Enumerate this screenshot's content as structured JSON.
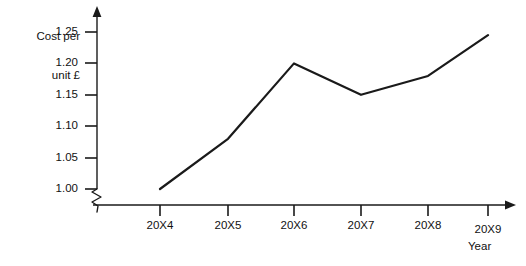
{
  "chart_data": {
    "type": "line",
    "title": "",
    "subtitle": "",
    "xlabel": "Year",
    "ylabel": "Cost per unit £",
    "categories": [
      "20X4",
      "20X5",
      "20X6",
      "20X7",
      "20X8",
      "20X9"
    ],
    "values": [
      1.0,
      1.08,
      1.2,
      1.15,
      1.18,
      1.245
    ],
    "series": [
      {
        "name": "Cost per unit",
        "values": [
          1.0,
          1.08,
          1.2,
          1.15,
          1.18,
          1.245
        ]
      }
    ],
    "ylim": [
      1.0,
      1.25
    ],
    "ytick_labels": [
      "1.25",
      "1.20",
      "1.15",
      "1.10",
      "1.05",
      "1.00"
    ],
    "ytick_values": [
      1.25,
      1.2,
      1.15,
      1.1,
      1.05,
      1.0
    ],
    "xtick_labels": [
      "20X4",
      "20X5",
      "20X6",
      "20X7",
      "20X8",
      "20X9"
    ],
    "grid": false,
    "legend": false,
    "legend_position": "none",
    "axis_break": true,
    "axis_break_note": "zigzag break on y-axis below 1.00",
    "line_color": "#1a1a1a",
    "axis_color": "#1a1a1a",
    "background_color": "#ffffff",
    "annotations": []
  },
  "labels": {
    "y_axis_title_line1": "Cost per",
    "y_axis_title_line2": "unit £",
    "x_axis_title": "Year"
  },
  "y_ticks": [
    {
      "label": "1.25"
    },
    {
      "label": "1.20"
    },
    {
      "label": "1.15"
    },
    {
      "label": "1.10"
    },
    {
      "label": "1.05"
    },
    {
      "label": "1.00"
    }
  ],
  "x_ticks": [
    {
      "label": "20X4"
    },
    {
      "label": "20X5"
    },
    {
      "label": "20X6"
    },
    {
      "label": "20X7"
    },
    {
      "label": "20X8"
    },
    {
      "label": "20X9"
    }
  ]
}
